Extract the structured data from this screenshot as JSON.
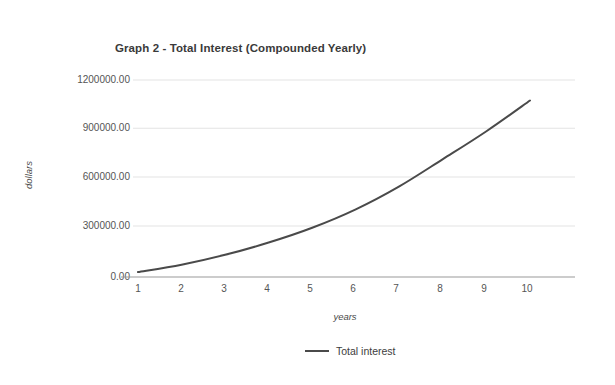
{
  "chart_data": {
    "type": "line",
    "title": "Graph 2 - Total Interest (Compounded Yearly)",
    "xlabel": "years",
    "ylabel": "dollars",
    "x": [
      1,
      2,
      3,
      4,
      5,
      6,
      7,
      8,
      9,
      10
    ],
    "xtick_labels": [
      "1",
      "2",
      "3",
      "4",
      "5",
      "6",
      "7",
      "8",
      "9",
      "10"
    ],
    "ytick_labels": [
      "0.00",
      "300000.00",
      "600000.00",
      "900000.00",
      "1200000.00"
    ],
    "ytick_values": [
      0,
      300000,
      600000,
      900000,
      1200000
    ],
    "xlim": [
      1,
      10
    ],
    "ylim": [
      0,
      1200000
    ],
    "grid": true,
    "legend_position": "bottom-center",
    "series": [
      {
        "name": "Total interest",
        "color": "#4a4a4a",
        "values": [
          30000,
          75000,
          135000,
          210000,
          300000,
          412000,
          552000,
          718000,
          888000,
          1075000
        ]
      }
    ]
  },
  "legend": {
    "label": "Total interest",
    "swatch_name": "line-swatch"
  },
  "colors": {
    "line": "#4a4a4a",
    "grid": "#e3e3e3",
    "axis": "#9a9a9a",
    "background": "#ffffff",
    "text": "#3d3d3d"
  }
}
